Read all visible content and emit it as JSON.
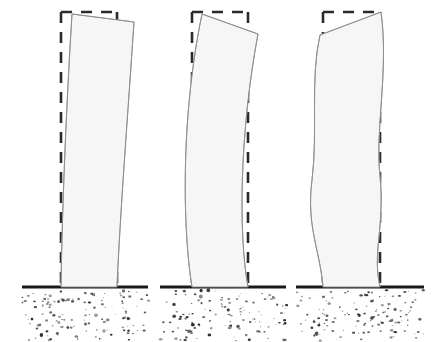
{
  "figure": {
    "kind": "structural-deformation-diagram",
    "canvas": {
      "width": 433,
      "height": 342
    },
    "colors": {
      "background": "#ffffff",
      "building_fill": "#f6f6f6",
      "building_outline": "#8d8d8d",
      "reference_dash": "#2b2b2b",
      "ground_line": "#1a1a1a",
      "soil_speckle": "#2a2a2a"
    },
    "style": {
      "building_outline_width": 0.9,
      "reference_dash_width": 2.6,
      "reference_dash_pattern": "11 9",
      "ground_line_width": 3.2
    }
  },
  "ground": {
    "line_y": 287,
    "soil_top": 289,
    "soil_bottom": 342,
    "segments": [
      {
        "name": "ground-segment-1",
        "x1": 22,
        "x2": 148
      },
      {
        "name": "ground-segment-2",
        "x1": 160,
        "x2": 286
      },
      {
        "name": "ground-segment-3",
        "x1": 296,
        "x2": 424
      }
    ],
    "soil_bands": [
      {
        "name": "soil-band-1",
        "x": 22,
        "width": 126
      },
      {
        "name": "soil-band-2",
        "x": 160,
        "width": 126
      },
      {
        "name": "soil-band-3",
        "x": 296,
        "width": 128
      }
    ]
  },
  "buildings": [
    {
      "id": "mode-1",
      "name": "building-mode-1",
      "label": "First mode shape",
      "base": {
        "left_x": 61,
        "right_x": 117,
        "y": 287
      },
      "reference_outline": {
        "left_x": 61,
        "right_x": 117,
        "top_y": 12,
        "bottom_y": 287
      },
      "roof": {
        "left_x": 72,
        "left_y": 14,
        "right_x": 134,
        "right_y": 22
      },
      "left_edge_path": "M 61 287 C 62 215 66 110 72 14",
      "right_edge_path": "M 134 22 C 128 112 120 215 117 287",
      "top_edge_path": "M 72 14 L 134 22",
      "curvature": "single curvature, tip drifts right",
      "tip_drift_px": 15
    },
    {
      "id": "mode-2",
      "name": "building-mode-2",
      "label": "Second mode shape",
      "base": {
        "left_x": 192,
        "right_x": 248,
        "y": 287
      },
      "reference_outline": {
        "left_x": 192,
        "right_x": 248,
        "top_y": 12,
        "bottom_y": 287
      },
      "roof": {
        "left_x": 202,
        "left_y": 14,
        "right_x": 258,
        "right_y": 34
      },
      "left_edge_path": "M 192 287 C 183 232 180 120 202 14",
      "right_edge_path": "M 258 34 C 240 130 238 232 248 287",
      "top_edge_path": "M 202 14 L 258 34",
      "curvature": "double curvature, bows left at mid-height then tips right",
      "tip_drift_px": 10
    },
    {
      "id": "mode-3",
      "name": "building-mode-3",
      "label": "Third mode shape",
      "base": {
        "left_x": 323,
        "right_x": 380,
        "y": 287
      },
      "reference_outline": {
        "left_x": 323,
        "right_x": 380,
        "top_y": 12,
        "bottom_y": 287
      },
      "roof": {
        "left_x": 320,
        "left_y": 35,
        "right_x": 381,
        "right_y": 12
      },
      "left_edge_path": "M 323 287 C 320 250 306 226 312 180 C 318 132 310 78 320 35",
      "right_edge_path": "M 381 12 C 389 70 375 128 380 176 C 385 228 372 252 380 287",
      "top_edge_path": "M 320 35 L 381 12",
      "curvature": "triple curvature S-shape, tip rotates left-up",
      "tip_drift_px": 3
    }
  ],
  "soil_speckles": {
    "count_per_band": 130,
    "min_radius": 0.5,
    "max_radius": 1.9,
    "seed": 20240607
  }
}
